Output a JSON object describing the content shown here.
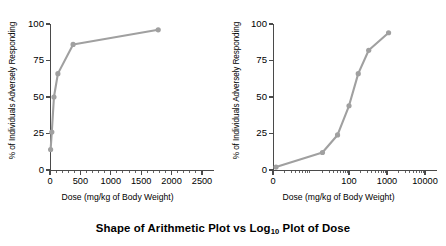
{
  "figure": {
    "title_before": "Shape of Arithmetic Plot vs Log",
    "title_sub": "10",
    "title_after": " Plot of Dose",
    "title_full": "Shape of Arithmetic Plot vs Log10 Plot of Dose",
    "line_color": "#a0a0a0",
    "axis_color": "#4a4a4a",
    "background": "#ffffff"
  },
  "chart_data": [
    {
      "type": "line",
      "title": "Arithmetic Plot of Dose",
      "xlabel": "Dose (mg/kg of Body Weight)",
      "ylabel": "% of Individuals Adversely Responding",
      "xscale": "linear",
      "yscale": "linear",
      "xlim": [
        0,
        2500
      ],
      "ylim": [
        0,
        100
      ],
      "xticks": [
        0,
        500,
        1000,
        1500,
        2000,
        2500
      ],
      "xticklabels": [
        "0",
        "500",
        "1000",
        "1500",
        "2000",
        "2500"
      ],
      "yticks": [
        0,
        25,
        50,
        75,
        100
      ],
      "yticklabels": [
        "0",
        "25",
        "50",
        "75",
        "100"
      ],
      "grid": false,
      "legend": null,
      "x": [
        10,
        30,
        65,
        130,
        380,
        1780
      ],
      "y": [
        14,
        26,
        50,
        66,
        86,
        96
      ],
      "marker": "circle",
      "color": "#a0a0a0"
    },
    {
      "type": "line",
      "title": "Log10 Plot of Dose",
      "xlabel": "Dose (mg/kg of Body Weight)",
      "ylabel": "% of Individuals Adversely Responding",
      "xscale": "log10",
      "yscale": "linear",
      "xlim": [
        1,
        10000
      ],
      "ylim": [
        0,
        100
      ],
      "xticks": [
        1,
        100,
        1000,
        10000
      ],
      "xticklabels": [
        "0",
        "100",
        "1000",
        "10000"
      ],
      "yticks": [
        0,
        25,
        50,
        75,
        100
      ],
      "yticklabels": [
        "0",
        "25",
        "50",
        "75",
        "100"
      ],
      "grid": false,
      "legend": null,
      "x": [
        1.2,
        20,
        50,
        100,
        175,
        330,
        1100
      ],
      "y": [
        2,
        12,
        24,
        44,
        66,
        82,
        94
      ],
      "marker": "circle",
      "color": "#a0a0a0"
    }
  ]
}
